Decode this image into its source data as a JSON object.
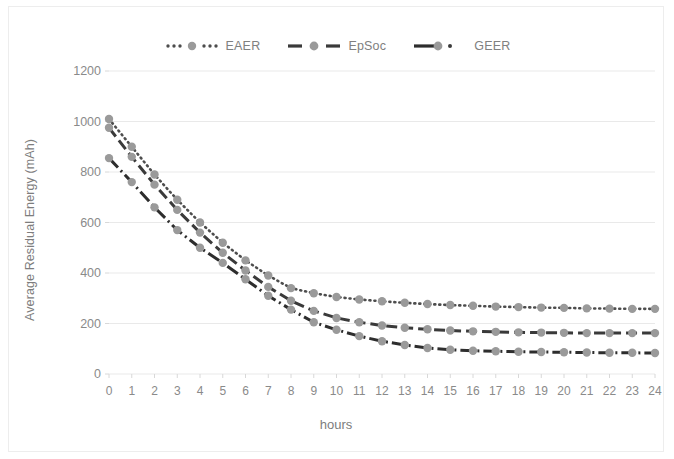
{
  "chart_data": {
    "type": "line",
    "title": "",
    "xlabel": "hours",
    "ylabel": "Average Residual Energy (mAh)",
    "xlim": [
      0,
      24
    ],
    "ylim": [
      0,
      1200
    ],
    "ytick_step": 200,
    "yticks": [
      0,
      200,
      400,
      600,
      800,
      1000,
      1200
    ],
    "xticks": [
      0,
      1,
      2,
      3,
      4,
      5,
      6,
      7,
      8,
      9,
      10,
      11,
      12,
      13,
      14,
      15,
      16,
      17,
      18,
      19,
      20,
      21,
      22,
      23,
      24
    ],
    "x": [
      0,
      1,
      2,
      3,
      4,
      5,
      6,
      7,
      8,
      9,
      10,
      11,
      12,
      13,
      14,
      15,
      16,
      17,
      18,
      19,
      20,
      21,
      22,
      23,
      24
    ],
    "grid": "horizontal",
    "legend_position": "top-center",
    "series": [
      {
        "name": "EAER",
        "marker": "circle",
        "line_style": "dotted",
        "color": "#4d4d4d",
        "marker_color": "#9a9a9a",
        "values": [
          1010,
          900,
          790,
          690,
          600,
          520,
          450,
          390,
          340,
          320,
          305,
          295,
          288,
          282,
          277,
          273,
          270,
          267,
          265,
          263,
          262,
          260,
          259,
          258,
          258
        ]
      },
      {
        "name": "EpSoc",
        "marker": "circle",
        "line_style": "dashed",
        "color": "#3a3a3a",
        "marker_color": "#9a9a9a",
        "values": [
          975,
          860,
          750,
          650,
          560,
          480,
          410,
          345,
          290,
          250,
          222,
          205,
          192,
          183,
          177,
          172,
          169,
          167,
          165,
          164,
          163,
          162,
          162,
          162,
          162
        ]
      },
      {
        "name": "GEER",
        "marker": "circle",
        "line_style": "dash-dot",
        "color": "#2d2d2d",
        "marker_color": "#9a9a9a",
        "values": [
          855,
          760,
          660,
          570,
          500,
          440,
          375,
          310,
          255,
          205,
          175,
          150,
          130,
          115,
          103,
          96,
          92,
          90,
          88,
          87,
          86,
          85,
          84,
          84,
          83
        ]
      }
    ]
  },
  "legend": {
    "items": [
      {
        "label": "EAER",
        "key": "dotted-marker-key"
      },
      {
        "label": "EpSoc",
        "key": "dashed-marker-key"
      },
      {
        "label": "GEER",
        "key": "dashdot-marker-key"
      }
    ]
  },
  "axes": {
    "y_title": "Average Residual Energy (mAh)",
    "x_title": "hours"
  }
}
